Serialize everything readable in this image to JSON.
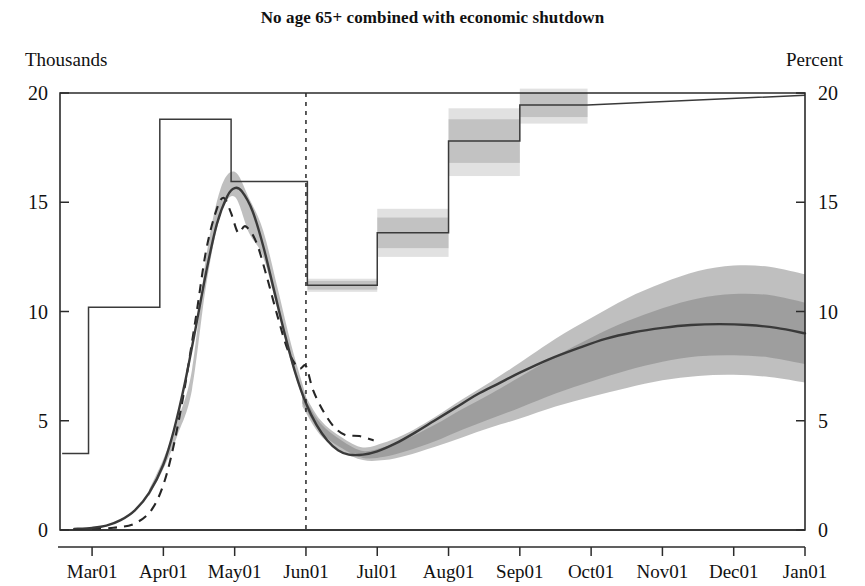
{
  "chart_data": {
    "type": "line",
    "title": "No age 65+ combined with economic shutdown",
    "ylabel_left": "Thousands",
    "ylabel_right": "Percent",
    "xlabel": "",
    "ylim": [
      0,
      20
    ],
    "yticks": [
      0,
      5,
      10,
      15,
      20
    ],
    "ytick_labels_left": [
      "0",
      "5",
      "10",
      "15",
      "20"
    ],
    "ytick_labels_right": [
      "0",
      "5",
      "10",
      "15",
      "20"
    ],
    "grid": false,
    "legend_position": "none",
    "xticks": [
      0,
      1,
      2,
      3,
      4,
      5,
      6,
      7,
      8,
      9,
      10
    ],
    "xtick_labels": [
      "Mar01",
      "Apr01",
      "May01",
      "Jun01",
      "Jul01",
      "Aug01",
      "Sep01",
      "Oct01",
      "Nov01",
      "Dec01",
      "Jan01"
    ],
    "forecast_start_label": "Jun01",
    "forecast_start_x": 3.0,
    "series": [
      {
        "name": "Deaths median (Thousands, left axis)",
        "style": "solid",
        "x": [
          -0.25,
          0.0,
          0.2,
          0.4,
          0.6,
          0.8,
          1.0,
          1.15,
          1.3,
          1.45,
          1.6,
          1.75,
          1.9,
          2.0,
          2.1,
          2.25,
          2.4,
          2.55,
          2.7,
          2.85,
          3.0,
          3.15,
          3.3,
          3.45,
          3.6,
          3.8,
          4.0,
          4.25,
          4.5,
          4.8,
          5.1,
          5.4,
          5.7,
          6.0,
          6.4,
          6.8,
          7.2,
          7.6,
          8.0,
          8.4,
          8.8,
          9.2,
          9.6,
          10.0
        ],
        "y": [
          0.05,
          0.1,
          0.2,
          0.45,
          0.9,
          1.7,
          3.0,
          4.6,
          6.7,
          9.2,
          11.8,
          14.0,
          15.3,
          15.65,
          15.5,
          14.6,
          13.0,
          11.0,
          9.0,
          7.2,
          5.8,
          4.8,
          4.1,
          3.65,
          3.45,
          3.45,
          3.6,
          3.95,
          4.4,
          5.0,
          5.6,
          6.2,
          6.7,
          7.2,
          7.8,
          8.3,
          8.75,
          9.05,
          9.25,
          9.38,
          9.42,
          9.38,
          9.25,
          9.0
        ]
      },
      {
        "name": "Deaths actual (Thousands, left axis)",
        "style": "dashed",
        "x": [
          0.0,
          0.3,
          0.6,
          0.85,
          1.05,
          1.25,
          1.45,
          1.6,
          1.75,
          1.85,
          1.95,
          2.05,
          2.15,
          2.3,
          2.45,
          2.6,
          2.75,
          2.9,
          3.0,
          3.1,
          3.25,
          3.4,
          3.55,
          3.75,
          3.95
        ],
        "y": [
          0.05,
          0.1,
          0.3,
          1.0,
          2.6,
          5.6,
          9.6,
          12.8,
          14.7,
          15.2,
          14.5,
          13.6,
          13.9,
          13.2,
          11.6,
          9.8,
          8.2,
          7.4,
          7.5,
          6.4,
          5.4,
          4.7,
          4.35,
          4.3,
          4.1
        ]
      },
      {
        "name": "Unemployment rate (Percent, right axis)",
        "style": "step",
        "steps": [
          {
            "x0": -0.42,
            "x1": -0.05,
            "y": 3.5,
            "band_inner": null,
            "band_outer": null
          },
          {
            "x0": -0.05,
            "x1": 0.95,
            "y": 10.2,
            "band_inner": null,
            "band_outer": null
          },
          {
            "x0": 0.95,
            "x1": 1.95,
            "y": 18.8,
            "band_inner": null,
            "band_outer": null
          },
          {
            "x0": 1.95,
            "x1": 3.02,
            "y": 15.95,
            "band_inner": null,
            "band_outer": null
          },
          {
            "x0": 3.02,
            "x1": 4.0,
            "y": 11.2,
            "band_inner": [
              11.0,
              11.4
            ],
            "band_outer": [
              10.9,
              11.5
            ]
          },
          {
            "x0": 4.0,
            "x1": 5.0,
            "y": 13.6,
            "band_inner": [
              12.9,
              14.3
            ],
            "band_outer": [
              12.5,
              14.7
            ]
          },
          {
            "x0": 5.0,
            "x1": 6.0,
            "y": 17.8,
            "band_inner": [
              16.8,
              18.8
            ],
            "band_outer": [
              16.2,
              19.3
            ]
          },
          {
            "x0": 6.0,
            "x1": 6.95,
            "y": 19.45,
            "band_inner": [
              18.9,
              20.0
            ],
            "band_outer": [
              18.6,
              20.2
            ]
          }
        ],
        "tail": {
          "x0": 6.95,
          "x1": 10.0,
          "y0": 19.45,
          "y1": 19.9
        }
      }
    ],
    "fan_chart": {
      "description": "Shaded uncertainty bands around the deaths median",
      "x": [
        2.95,
        3.2,
        3.5,
        3.8,
        4.1,
        4.4,
        4.8,
        5.2,
        5.6,
        6.0,
        6.5,
        7.0,
        7.5,
        8.0,
        8.5,
        9.0,
        9.5,
        10.0
      ],
      "median": [
        6.0,
        4.7,
        3.9,
        3.45,
        3.55,
        3.85,
        4.4,
        5.05,
        5.65,
        6.3,
        7.1,
        7.8,
        8.45,
        8.95,
        9.3,
        9.42,
        9.35,
        9.0
      ],
      "inner_lower": [
        5.8,
        4.5,
        3.75,
        3.3,
        3.35,
        3.6,
        4.05,
        4.6,
        5.1,
        5.6,
        6.25,
        6.8,
        7.3,
        7.7,
        7.95,
        8.0,
        7.9,
        7.6
      ],
      "inner_upper": [
        6.2,
        4.9,
        4.1,
        3.62,
        3.8,
        4.15,
        4.8,
        5.55,
        6.25,
        7.0,
        7.95,
        8.8,
        9.55,
        10.15,
        10.6,
        10.8,
        10.75,
        10.4
      ],
      "outer_lower": [
        5.65,
        4.35,
        3.62,
        3.2,
        3.2,
        3.4,
        3.8,
        4.25,
        4.7,
        5.1,
        5.65,
        6.1,
        6.5,
        6.85,
        7.05,
        7.1,
        7.0,
        6.75
      ],
      "outer_upper": [
        6.4,
        5.05,
        4.25,
        3.78,
        4.0,
        4.4,
        5.15,
        6.0,
        6.8,
        7.65,
        8.75,
        9.7,
        10.6,
        11.3,
        11.85,
        12.1,
        12.05,
        11.7
      ]
    },
    "epidemic_band": {
      "description": "Thin uncertainty band hugging the deaths median over the historical epidemic wave",
      "x": [
        0.8,
        1.0,
        1.2,
        1.4,
        1.6,
        1.8,
        2.0,
        2.2,
        2.4,
        2.6,
        2.8,
        3.0
      ],
      "lower": [
        1.55,
        2.8,
        4.35,
        6.4,
        11.2,
        14.4,
        15.25,
        13.6,
        12.5,
        10.1,
        7.6,
        5.6
      ],
      "upper": [
        1.85,
        3.25,
        5.0,
        7.3,
        12.5,
        15.6,
        16.4,
        15.2,
        13.7,
        11.1,
        8.4,
        6.15
      ]
    },
    "colors": {
      "fan_outer": "#b4b4b4",
      "fan_mid": "#9a9a9a",
      "fan_inner": "#8a8a8a",
      "median_line": "#3a3a3a",
      "actual_line": "#262626",
      "step_line": "#3a3a3a",
      "step_band_outer": "#c9c9c9",
      "step_band_inner": "#a9a9a9",
      "axis": "#2b2b2b",
      "background": "#ffffff"
    }
  }
}
